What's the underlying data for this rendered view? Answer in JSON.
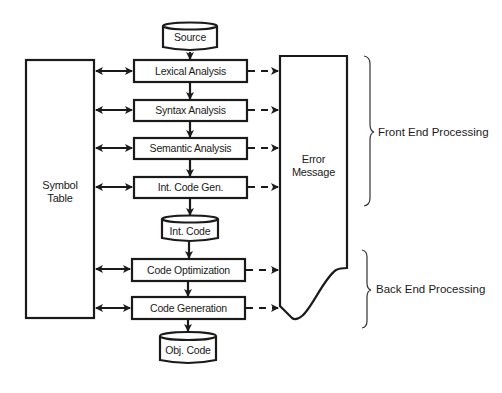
{
  "diagram": {
    "type": "compiler-phases-flowchart",
    "inputs": {
      "source": "Source"
    },
    "phases": [
      {
        "id": "lexical",
        "label": "Lexical Analysis"
      },
      {
        "id": "syntax",
        "label": "Syntax Analysis"
      },
      {
        "id": "semantic",
        "label": "Semantic Analysis"
      },
      {
        "id": "intcodegen",
        "label": "Int. Code Gen."
      },
      {
        "id": "codeopt",
        "label": "Code Optimization"
      },
      {
        "id": "codegen",
        "label": "Code Generation"
      }
    ],
    "stores": {
      "source": "Source",
      "int_code": "Int. Code",
      "obj_code": "Obj. Code"
    },
    "symbol_table": {
      "line1": "Symbol",
      "line2": "Table"
    },
    "error_message": {
      "line1": "Error",
      "line2": "Message"
    },
    "groups": {
      "front_end": "Front End Processing",
      "back_end": "Back End Processing"
    },
    "edges": [
      {
        "from": "Source",
        "to": "Lexical Analysis",
        "style": "solid"
      },
      {
        "from": "Lexical Analysis",
        "to": "Syntax Analysis",
        "style": "solid"
      },
      {
        "from": "Syntax Analysis",
        "to": "Semantic Analysis",
        "style": "solid"
      },
      {
        "from": "Semantic Analysis",
        "to": "Int. Code Gen.",
        "style": "solid"
      },
      {
        "from": "Int. Code Gen.",
        "to": "Int. Code",
        "style": "solid"
      },
      {
        "from": "Int. Code",
        "to": "Code Optimization",
        "style": "solid"
      },
      {
        "from": "Code Optimization",
        "to": "Code Generation",
        "style": "solid"
      },
      {
        "from": "Code Generation",
        "to": "Obj. Code",
        "style": "solid"
      },
      {
        "from": "Symbol Table",
        "to": "each phase",
        "style": "bidirectional"
      },
      {
        "from": "each phase",
        "to": "Error Message",
        "style": "dashed"
      }
    ]
  }
}
